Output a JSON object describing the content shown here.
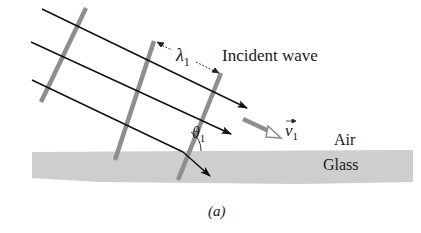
{
  "figure": {
    "caption": "(a)",
    "labels": {
      "incident_wave": "Incident wave",
      "wavelength_symbol": "λ",
      "wavelength_subscript": "1",
      "angle_symbol": "θ",
      "angle_subscript": "1",
      "velocity_symbol": "v",
      "velocity_subscript": "1",
      "air": "Air",
      "glass": "Glass"
    },
    "colors": {
      "ray": "#111111",
      "wavefront": "#8e8e8e",
      "glass": "#cfcfcf",
      "velocity_arrow": "#8e8e8e"
    },
    "elements": {
      "rays": 3,
      "wavefronts": 3,
      "interface": "air-glass boundary"
    }
  }
}
